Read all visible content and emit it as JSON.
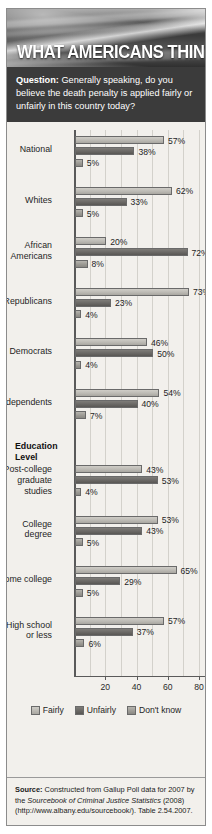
{
  "header": {
    "title": "WHAT AMERICANS THINK",
    "question_label": "Question:",
    "question_text": " Generally speaking, do you believe the death penalty is applied fairly or unfairly in this country today?"
  },
  "source": {
    "label": "Source:",
    "line1": " Constructed from Gallup Poll data for 2007 by the ",
    "italic": "Sourcebook of Criminal Justice Statistics",
    "line2": " (2008) (http://www.albany.edu/sourcebook/). Table 2.54.2007."
  },
  "chart_data": {
    "type": "bar",
    "orientation": "horizontal",
    "title": "WHAT AMERICANS THINK",
    "xlabel": "",
    "ylabel": "",
    "xlim": [
      0,
      80
    ],
    "ticks": [
      20,
      40,
      60,
      80
    ],
    "tick_labels": [
      "20",
      "40",
      "60",
      "80"
    ],
    "grid": true,
    "legend_position": "bottom",
    "legend": [
      "Fairly",
      "Unfairly",
      "Don't know"
    ],
    "series": [
      {
        "name": "Fairly",
        "values": [
          57,
          62,
          20,
          73,
          46,
          54,
          43,
          53,
          65,
          57
        ]
      },
      {
        "name": "Unfairly",
        "values": [
          38,
          33,
          72,
          23,
          50,
          40,
          53,
          43,
          29,
          37
        ]
      },
      {
        "name": "Don't know",
        "values": [
          5,
          5,
          8,
          4,
          4,
          7,
          4,
          5,
          5,
          6
        ]
      }
    ],
    "categories": [
      "National",
      "Whites",
      "African Americans",
      "Republicans",
      "Democrats",
      "Independents",
      "Post-college graduate studies",
      "College degree",
      "Some college",
      "High school or less"
    ],
    "section_headers": [
      {
        "label": "Education Level",
        "before_category": "Post-college graduate studies"
      }
    ],
    "rows": [
      {
        "label_lines": [
          "National"
        ],
        "fairly": 57,
        "unfairly": 38,
        "dont_know": 5,
        "fairly_text": "57%",
        "unfairly_text": "38%",
        "dont_know_text": "5%"
      },
      {
        "label_lines": [
          "Whites"
        ],
        "fairly": 62,
        "unfairly": 33,
        "dont_know": 5,
        "fairly_text": "62%",
        "unfairly_text": "33%",
        "dont_know_text": "5%"
      },
      {
        "label_lines": [
          "African",
          "Americans"
        ],
        "fairly": 20,
        "unfairly": 72,
        "dont_know": 8,
        "fairly_text": "20%",
        "unfairly_text": "72%",
        "dont_know_text": "8%"
      },
      {
        "label_lines": [
          "Republicans"
        ],
        "fairly": 73,
        "unfairly": 23,
        "dont_know": 4,
        "fairly_text": "73%",
        "unfairly_text": "23%",
        "dont_know_text": "4%"
      },
      {
        "label_lines": [
          "Democrats"
        ],
        "fairly": 46,
        "unfairly": 50,
        "dont_know": 4,
        "fairly_text": "46%",
        "unfairly_text": "50%",
        "dont_know_text": "4%"
      },
      {
        "label_lines": [
          "Independents"
        ],
        "fairly": 54,
        "unfairly": 40,
        "dont_know": 7,
        "fairly_text": "54%",
        "unfairly_text": "40%",
        "dont_know_text": "7%"
      },
      {
        "label_lines": [
          "Post-college",
          "graduate",
          "studies"
        ],
        "fairly": 43,
        "unfairly": 53,
        "dont_know": 4,
        "fairly_text": "43%",
        "unfairly_text": "53%",
        "dont_know_text": "4%"
      },
      {
        "label_lines": [
          "College",
          "degree"
        ],
        "fairly": 53,
        "unfairly": 43,
        "dont_know": 5,
        "fairly_text": "53%",
        "unfairly_text": "43%",
        "dont_know_text": "5%"
      },
      {
        "label_lines": [
          "Some college"
        ],
        "fairly": 65,
        "unfairly": 29,
        "dont_know": 5,
        "fairly_text": "65%",
        "unfairly_text": "29%",
        "dont_know_text": "5%"
      },
      {
        "label_lines": [
          "High school",
          "or less"
        ],
        "fairly": 57,
        "unfairly": 37,
        "dont_know": 6,
        "fairly_text": "57%",
        "unfairly_text": "37%",
        "dont_know_text": "6%"
      }
    ],
    "education_header_lines": [
      "Education",
      "Level"
    ]
  },
  "colors": {
    "fairly": "#bcbab4",
    "unfairly": "#6a6865",
    "dont_know": "#9c9a94",
    "banner_bg": "#3a3a3a",
    "question_bg": "#3b3b3b",
    "card_bg": "#f2f0ec"
  }
}
